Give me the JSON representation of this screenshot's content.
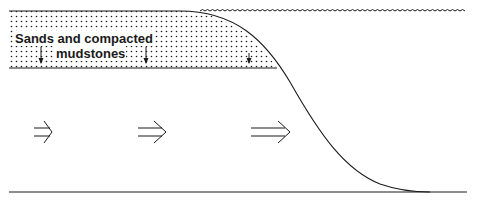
{
  "diagram": {
    "type": "geological cross-section",
    "layer_label_line1": "Sands and compacted",
    "layer_label_line2": "mudstones",
    "elements": {
      "sediment_layer": {
        "fill": "stippled dots",
        "top_y": 11,
        "bottom_y": 68,
        "x_start": 9,
        "x_end": 277
      },
      "water_surface": {
        "style": "wavy line",
        "x_start": 200,
        "x_end": 470,
        "y": 11
      },
      "slope_curve": {
        "from": [
          180,
          11
        ],
        "to": [
          430,
          192
        ]
      },
      "basement_line": {
        "y": 192,
        "x_start": 9,
        "x_end": 467
      },
      "compaction_arrows": {
        "direction": "down",
        "count": 3,
        "x": [
          41,
          146,
          249
        ]
      },
      "flow_arrows": {
        "direction": "right",
        "count": 3,
        "sizes": [
          "small",
          "medium",
          "large"
        ]
      }
    },
    "colors": {
      "line": "#1a1a1a",
      "background": "#ffffff"
    }
  }
}
